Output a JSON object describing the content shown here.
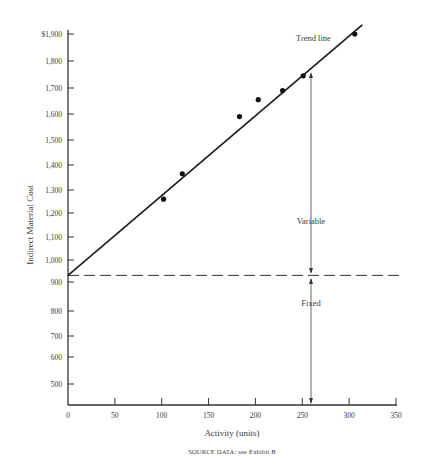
{
  "chart_data": {
    "type": "scatter",
    "title": "",
    "xlabel": "Activity (units)",
    "ylabel": "Indirect Material Cost",
    "caption": "SOURCE DATA: see Exhibit B",
    "xlim": [
      0,
      350
    ],
    "ylim": [
      400,
      1900
    ],
    "x_ticks": [
      0,
      50,
      100,
      150,
      200,
      250,
      300,
      350
    ],
    "y_ticks": [
      {
        "value": 1900,
        "label": "$1,900"
      },
      {
        "value": 1800,
        "label": "1,800"
      },
      {
        "value": 1700,
        "label": "1,700"
      },
      {
        "value": 1600,
        "label": "1,600"
      },
      {
        "value": 1500,
        "label": "1,500"
      },
      {
        "value": 1400,
        "label": "1,400"
      },
      {
        "value": 1300,
        "label": "1,300"
      },
      {
        "value": 1200,
        "label": "1,200"
      },
      {
        "value": 1100,
        "label": "1,100"
      },
      {
        "value": 1000,
        "label": "1,000"
      },
      {
        "value": 900,
        "label": "900"
      },
      {
        "value": 800,
        "label": "800"
      },
      {
        "value": 700,
        "label": "700"
      },
      {
        "value": 600,
        "label": "600"
      },
      {
        "value": 500,
        "label": "500"
      }
    ],
    "series": [
      {
        "name": "Observations",
        "points": [
          {
            "x": 102,
            "y": 1260
          },
          {
            "x": 122,
            "y": 1365
          },
          {
            "x": 183,
            "y": 1590
          },
          {
            "x": 203,
            "y": 1655
          },
          {
            "x": 229,
            "y": 1690
          },
          {
            "x": 251,
            "y": 1745
          },
          {
            "x": 306,
            "y": 1900
          }
        ]
      }
    ],
    "trend_line": {
      "label": "Trend line",
      "from": {
        "x": 0,
        "y": 930
      },
      "to": {
        "x": 314,
        "y": 1935
      }
    },
    "fixed_cost_line": {
      "y": 930,
      "style": "dashed"
    },
    "annotations": {
      "trend": "Trend line",
      "variable": "Variable",
      "fixed": "Fixed",
      "marker_x": 258
    },
    "grid": false,
    "legend": "none"
  }
}
